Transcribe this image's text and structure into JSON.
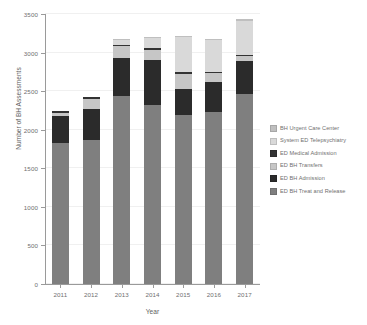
{
  "chart_data": {
    "type": "bar",
    "stacked": true,
    "title": "",
    "xlabel": "Year",
    "ylabel": "Number of BH Assessments",
    "categories": [
      "2011",
      "2012",
      "2013",
      "2014",
      "2015",
      "2016",
      "2017"
    ],
    "ylim": [
      0,
      3500
    ],
    "yticks": [
      0,
      500,
      1000,
      1500,
      2000,
      2500,
      3000,
      3500
    ],
    "grid": true,
    "legend_position": "right",
    "series": [
      {
        "name": "ED BH Treat and Release",
        "color": "#7f7f7f",
        "values": [
          1830,
          1865,
          2440,
          2320,
          2185,
          2235,
          2465
        ]
      },
      {
        "name": "ED BH Admission",
        "color": "#2b2b2b",
        "values": [
          345,
          410,
          490,
          590,
          345,
          390,
          425
        ]
      },
      {
        "name": "ED BH Transfers",
        "color": "#c6c6c6",
        "values": [
          40,
          130,
          150,
          120,
          190,
          105,
          60
        ]
      },
      {
        "name": "ED Medical Admission",
        "color": "#333333",
        "values": [
          25,
          20,
          25,
          30,
          25,
          25,
          25
        ]
      },
      {
        "name": "System ED Telepsychiatry",
        "color": "#d9d9d9",
        "values": [
          0,
          0,
          60,
          125,
          455,
          405,
          440
        ]
      },
      {
        "name": "BH Urgent Care Center",
        "color": "#bfbfbf",
        "values": [
          0,
          0,
          15,
          15,
          20,
          15,
          15
        ]
      }
    ],
    "totals": [
      2240,
      2425,
      3180,
      3200,
      3220,
      3175,
      3430
    ]
  },
  "legend": {
    "items": [
      {
        "label": "BH Urgent Care Center",
        "color": "#bfbfbf"
      },
      {
        "label": "System ED Telepsychiatry",
        "color": "#d9d9d9"
      },
      {
        "label": "ED Medical Admission",
        "color": "#333333"
      },
      {
        "label": "ED BH Transfers",
        "color": "#c6c6c6"
      },
      {
        "label": "ED BH Admission",
        "color": "#2b2b2b"
      },
      {
        "label": "ED BH Treat and Release",
        "color": "#7f7f7f"
      }
    ]
  }
}
